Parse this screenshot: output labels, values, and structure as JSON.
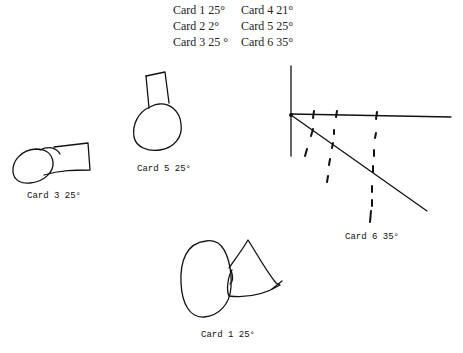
{
  "legend": {
    "items": [
      {
        "label": "Card 1 25°"
      },
      {
        "label": "Card 2 2°"
      },
      {
        "label": "Card 3 25 °"
      },
      {
        "label": "Card 4 21°"
      },
      {
        "label": "Card 5 25°"
      },
      {
        "label": "Card 6 35°"
      }
    ]
  },
  "drawings": [
    {
      "id": "card3",
      "caption": "Card 3   25°"
    },
    {
      "id": "card5",
      "caption": "Card 5   25°"
    },
    {
      "id": "card6",
      "caption": "Card 6   35°"
    },
    {
      "id": "card1",
      "caption": "Card 1   25°"
    }
  ]
}
